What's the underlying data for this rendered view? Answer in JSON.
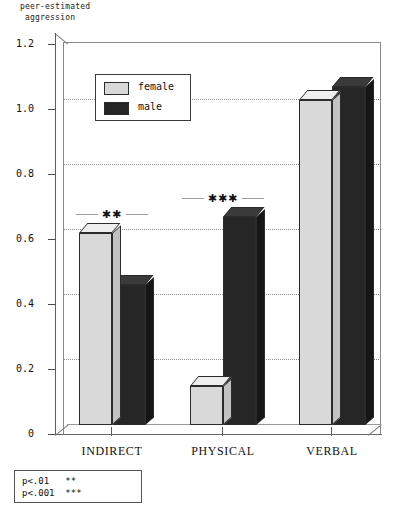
{
  "chart_data": {
    "type": "bar",
    "title": "",
    "ylabel": "peer-estimated\naggression",
    "xlabel": "",
    "categories": [
      "INDIRECT",
      "PHYSICAL",
      "VERBAL"
    ],
    "series": [
      {
        "name": "female",
        "values": [
          0.59,
          0.12,
          1.0
        ],
        "color": "#d9d9d9"
      },
      {
        "name": "male",
        "values": [
          0.43,
          0.64,
          1.04
        ],
        "color": "#262626"
      }
    ],
    "ylim": [
      0,
      1.2
    ],
    "ytick_labels": [
      "0",
      "0.2",
      "0.4",
      "0.6",
      "0.8",
      "1.0",
      "1.2"
    ],
    "ytick_values": [
      0,
      0.2,
      0.4,
      0.6,
      0.8,
      1.0,
      1.2
    ],
    "grid": true,
    "grid_axis": "y",
    "legend_position": "top-left",
    "annotations": [
      {
        "category": "INDIRECT",
        "stars": "✱✱"
      },
      {
        "category": "PHYSICAL",
        "stars": "✱✱✱"
      }
    ]
  },
  "legend": {
    "items": [
      {
        "label": "female"
      },
      {
        "label": "male"
      }
    ]
  },
  "footnote": {
    "lines": [
      "p<.01   **",
      "p<.001  ***"
    ]
  }
}
